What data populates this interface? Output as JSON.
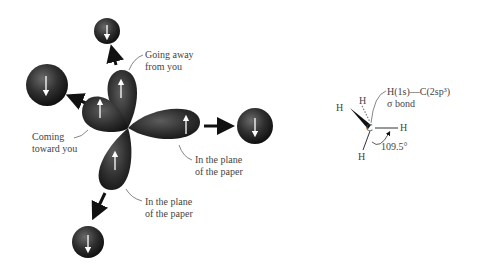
{
  "left_diagram": {
    "labels": {
      "going_away_line1": "Going away",
      "going_away_line2": "from you",
      "coming_toward_line1": "Coming",
      "coming_toward_line2": "toward you",
      "plane_right_line1": "In the plane",
      "plane_right_line2": "of the paper",
      "plane_bottom_line1": "In the plane",
      "plane_bottom_line2": "of the paper"
    },
    "orbital_color": "#2b2b2b",
    "hydrogen_color": "#2b2b2b",
    "spin_up": "↑",
    "spin_down": "↓"
  },
  "right_diagram": {
    "atoms": {
      "carbon": "C",
      "h_top": "H",
      "h_left": "H",
      "h_right": "H",
      "h_bottom": "H"
    },
    "bond_label_line1": "H(1s)—C(2sp³)",
    "bond_label_line2": "σ bond",
    "angle": "109.5°"
  }
}
